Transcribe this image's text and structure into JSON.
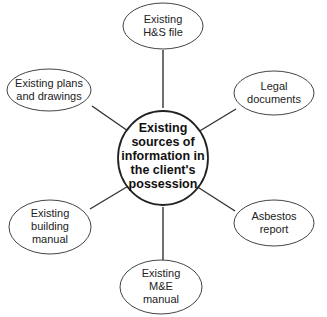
{
  "diagram": {
    "type": "mind-map",
    "center": {
      "lines": [
        "Existing",
        "sources of",
        "information in",
        "the client's",
        "possession"
      ]
    },
    "nodes": [
      {
        "id": "hs-file",
        "lines": [
          "Existing",
          "H&S file"
        ]
      },
      {
        "id": "legal-documents",
        "lines": [
          "Legal",
          "documents"
        ]
      },
      {
        "id": "asbestos-report",
        "lines": [
          "Asbestos",
          "report"
        ]
      },
      {
        "id": "me-manual",
        "lines": [
          "Existing",
          "M&E",
          "manual"
        ]
      },
      {
        "id": "building-manual",
        "lines": [
          "Existing",
          "building",
          "manual"
        ]
      },
      {
        "id": "plans-drawings",
        "lines": [
          "Existing plans",
          "and drawings"
        ]
      }
    ],
    "colors": {
      "stroke": "#333333",
      "background": "#ffffff",
      "text": "#222222"
    }
  }
}
